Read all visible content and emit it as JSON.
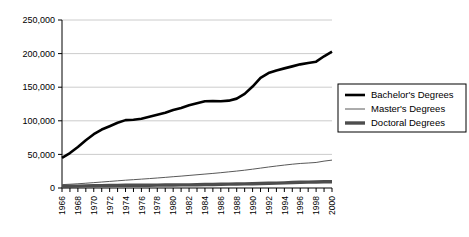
{
  "chart_data": {
    "type": "line",
    "title": "",
    "xlabel": "",
    "ylabel": "",
    "xlim": [
      1966,
      2000
    ],
    "ylim": [
      0,
      250000
    ],
    "grid": true,
    "legend_position": "right",
    "y_ticks": [
      0,
      50000,
      100000,
      150000,
      200000,
      250000
    ],
    "y_tick_labels": [
      "0",
      "50,000",
      "100,000",
      "150,000",
      "200,000",
      "250,000"
    ],
    "x_ticks": [
      1966,
      1967,
      1968,
      1969,
      1970,
      1971,
      1972,
      1973,
      1974,
      1975,
      1976,
      1977,
      1978,
      1979,
      1980,
      1981,
      1982,
      1983,
      1984,
      1985,
      1986,
      1987,
      1988,
      1989,
      1990,
      1991,
      1992,
      1993,
      1994,
      1995,
      1996,
      1997,
      1998,
      1999,
      2000
    ],
    "x_tick_labels": [
      "1966",
      "1968",
      "1970",
      "1972",
      "1974",
      "1976",
      "1978",
      "1980",
      "1982",
      "1984",
      "1986",
      "1988",
      "1990",
      "1992",
      "1994",
      "1996",
      "1998",
      "2000"
    ],
    "x_tick_label_years": [
      1966,
      1968,
      1970,
      1972,
      1974,
      1976,
      1978,
      1980,
      1982,
      1984,
      1986,
      1988,
      1990,
      1992,
      1994,
      1996,
      1998,
      2000
    ],
    "x": [
      1966,
      1967,
      1968,
      1969,
      1970,
      1971,
      1972,
      1973,
      1974,
      1975,
      1976,
      1977,
      1978,
      1979,
      1980,
      1981,
      1982,
      1983,
      1984,
      1985,
      1986,
      1987,
      1988,
      1989,
      1990,
      1991,
      1992,
      1993,
      1994,
      1995,
      1996,
      1997,
      1998,
      1999,
      2000
    ],
    "series": [
      {
        "name": "Bachelor's Degrees",
        "color": "#000000",
        "width": 2.6,
        "values": [
          45000,
          52000,
          61000,
          71000,
          80000,
          87000,
          92000,
          97000,
          101000,
          101500,
          103000,
          106000,
          109000,
          112000,
          116000,
          119000,
          123000,
          126000,
          129000,
          129500,
          129000,
          130000,
          133000,
          140000,
          151000,
          164000,
          171000,
          175000,
          178000,
          181000,
          184000,
          186000,
          188000,
          196000,
          203000
        ]
      },
      {
        "name": "Master's Degrees",
        "color": "#595959",
        "width": 1.0,
        "values": [
          5000,
          5600,
          6300,
          7100,
          8000,
          8900,
          9800,
          10700,
          11600,
          12400,
          13200,
          14000,
          14900,
          15800,
          16800,
          17700,
          18700,
          19700,
          20700,
          21700,
          22800,
          24000,
          25200,
          26500,
          28000,
          29600,
          31200,
          32700,
          34100,
          35400,
          36500,
          37200,
          38000,
          40000,
          41500
        ]
      },
      {
        "name": "Doctoral Degrees",
        "color": "#4d4d4d",
        "width": 3.4,
        "values": [
          2300,
          2500,
          2800,
          3100,
          3400,
          3600,
          3800,
          3900,
          4000,
          4100,
          4150,
          4200,
          4300,
          4400,
          4500,
          4600,
          4700,
          4900,
          5100,
          5300,
          5500,
          5700,
          5900,
          6100,
          6400,
          6700,
          7000,
          7300,
          7700,
          8100,
          8500,
          8800,
          9000,
          9200,
          9300
        ]
      }
    ]
  },
  "legend": {
    "items": [
      {
        "label": "Bachelor's Degrees",
        "swatch": "bachelors-swatch"
      },
      {
        "label": "Master's Degrees",
        "swatch": "masters-swatch"
      },
      {
        "label": "Doctoral Degrees",
        "swatch": "doctoral-swatch"
      }
    ]
  }
}
